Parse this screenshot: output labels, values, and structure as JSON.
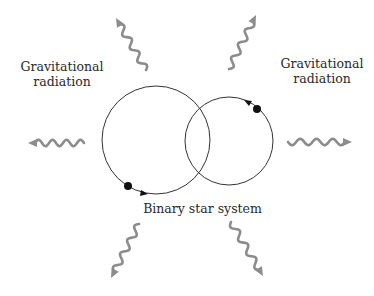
{
  "labels": {
    "left_radiation_line1": "Gravitational",
    "left_radiation_line2": "radiation",
    "right_radiation_line1": "Gravitational",
    "right_radiation_line2": "radiation",
    "system": "Binary star system"
  },
  "diagram": {
    "nodes": [
      {
        "id": "star-a",
        "kind": "star",
        "orbit": "large-orbit",
        "direction": "counterclockwise"
      },
      {
        "id": "star-b",
        "kind": "star",
        "orbit": "small-orbit",
        "direction": "counterclockwise"
      }
    ],
    "orbits": [
      {
        "id": "large-orbit"
      },
      {
        "id": "small-orbit"
      }
    ],
    "radiation_arrows": [
      "up-left",
      "up-right",
      "left",
      "right",
      "down-left",
      "down-right"
    ]
  },
  "colors": {
    "orbit": "#333333",
    "star": "#111111",
    "radiation": "#8c8c8c",
    "text": "#2a2a2a"
  }
}
